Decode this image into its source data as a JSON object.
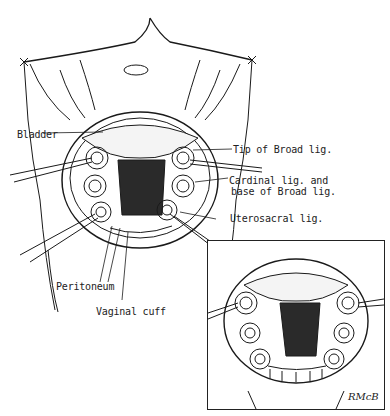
{
  "figure": {
    "type": "surgical line illustration",
    "colors": {
      "ink": "#1a1a1a",
      "paper": "#ffffff",
      "shading": "#333333"
    }
  },
  "labels": {
    "bladder": "Bladder",
    "tip_broad_lig": "Tip of Broad lig.",
    "cardinal_lig_line1": "Cardinal lig. and",
    "cardinal_lig_line2": "base of Broad lig.",
    "uterosacral_lig": "Uterosacral lig.",
    "peritoneum": "Peritoneum",
    "vaginal_cuff": "Vaginal cuff"
  },
  "inset": {
    "present": true,
    "signature": "RMcB"
  }
}
